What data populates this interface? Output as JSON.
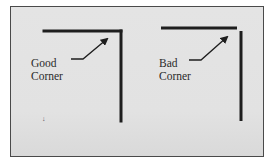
{
  "diagram": {
    "background": "#e3e3e3",
    "border_color": "#4a4a4a",
    "line_color": "#1e1e1e",
    "panels": [
      {
        "id": "good",
        "label_line1": "Good",
        "label_line2": "Corner",
        "corner_type": "joined"
      },
      {
        "id": "bad",
        "label_line1": "Bad",
        "label_line2": "Corner",
        "corner_type": "gapped"
      }
    ],
    "stray_mark": "↓"
  }
}
